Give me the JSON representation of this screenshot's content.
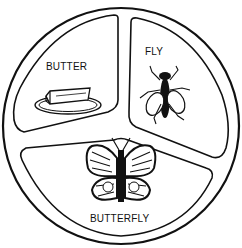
{
  "diagram": {
    "type": "three-part circle",
    "stroke_color": "#111111",
    "background": "#ffffff",
    "sections": [
      {
        "id": "butter",
        "label": "BUTTER",
        "icon": "butter-dish-icon"
      },
      {
        "id": "fly",
        "label": "FLY",
        "icon": "fly-icon"
      },
      {
        "id": "butterfly",
        "label": "BUTTERFLY",
        "icon": "butterfly-icon"
      }
    ]
  }
}
